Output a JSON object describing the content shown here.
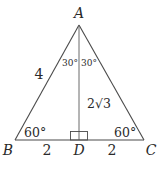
{
  "diagram": {
    "type": "triangle",
    "vertices": {
      "A": "A",
      "B": "B",
      "C": "C",
      "D": "D"
    },
    "side_labels": {
      "AB": "4",
      "BD": "2",
      "DC": "2",
      "AD_prefix": "2",
      "AD_radical": "√3"
    },
    "angle_labels": {
      "BAD": "30°",
      "DAC": "30°",
      "ABD": "60°",
      "ACD": "60°"
    },
    "right_angle_marker": "D",
    "colors": {
      "stroke": "#4a4a4a",
      "text": "#2a2a2a"
    }
  }
}
